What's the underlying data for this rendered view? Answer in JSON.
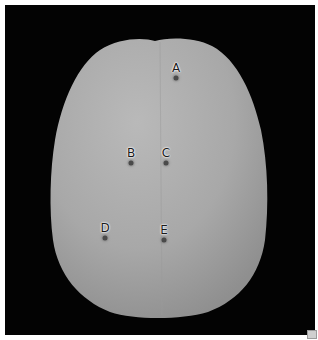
{
  "image": {
    "subject": "skull-top-view",
    "background_color": "#030303",
    "border_color": "#ffffff",
    "surface_color": "#a9a9a9"
  },
  "markers": [
    {
      "label": "A",
      "x": 176,
      "y": 78
    },
    {
      "label": "B",
      "x": 131,
      "y": 163
    },
    {
      "label": "C",
      "x": 166,
      "y": 163
    },
    {
      "label": "D",
      "x": 105,
      "y": 238
    },
    {
      "label": "E",
      "x": 164,
      "y": 240
    }
  ]
}
